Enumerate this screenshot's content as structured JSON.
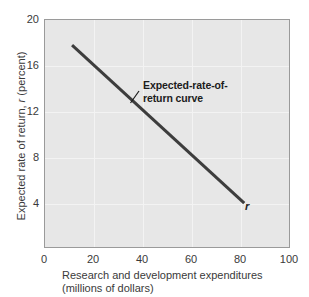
{
  "chart_data": {
    "type": "line",
    "title": "",
    "xlabel_lines": [
      "Research and development expenditures",
      "(millions of dollars)"
    ],
    "ylabel": "Expected rate of return, r (percent)",
    "ylabel_prefix": "Expected rate of return, ",
    "ylabel_italic": "r",
    "ylabel_suffix": " (percent)",
    "xlim": [
      0,
      100
    ],
    "ylim": [
      0,
      20
    ],
    "xticks": [
      0,
      20,
      40,
      60,
      80,
      100
    ],
    "yticks": [
      4,
      8,
      12,
      16,
      20
    ],
    "grid": true,
    "legend": "none",
    "series": [
      {
        "name": "Expected-rate-of-return curve",
        "points": [
          {
            "x": 11,
            "y": 17.8
          },
          {
            "x": 81,
            "y": 4.0
          }
        ],
        "color": "#3d3d3d",
        "line_width": 3
      }
    ],
    "annotations": [
      {
        "name": "curve-label",
        "lines": [
          "Expected-rate-of-",
          "return curve"
        ],
        "bold": true,
        "x": 43,
        "y": 12.6
      },
      {
        "name": "curve-symbol",
        "text": "r",
        "italic": true,
        "bold": true,
        "x": 82,
        "y": 4.0
      }
    ]
  },
  "colors": {
    "plot_background": "#e7e7e7",
    "plot_border": "#9a9a9a",
    "gridline": "#f3f3f3",
    "curve": "#3d3d3d",
    "text": "#3a3a3a",
    "annotation_text": "#1c1c1c",
    "page_background": "#ffffff"
  }
}
